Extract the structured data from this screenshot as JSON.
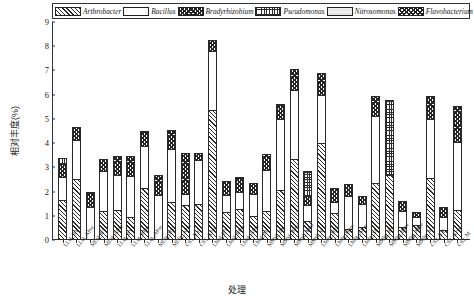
{
  "chart_data": {
    "type": "bar",
    "subtype": "stacked",
    "title": "",
    "xlabel": "处理",
    "ylabel": "相对丰度(%)",
    "ylim": [
      0,
      9
    ],
    "yticks": [
      0,
      1,
      2,
      3,
      4,
      5,
      6,
      7,
      8,
      9
    ],
    "grid": false,
    "legend_position": "top",
    "legend_italic": true,
    "categories": [
      "LLsl_BY",
      "LLsl_APre",
      "MLsl_BY",
      "MLsl_APre",
      "LLlg_BY",
      "LLlg_BPre",
      "LLlg_APre",
      "MLlg_BY",
      "MLlg_APre",
      "CS1_BY",
      "CS1_APre",
      "LMsl_BY",
      "LMsl_BPre",
      "LMsl_APre",
      "LMsl_M",
      "MMsl_BY",
      "MMsl_BPre",
      "MMsl_APre",
      "MMsl_M",
      "LMlg_BY",
      "LMlg_BPre",
      "LMlg_APre",
      "LMlg_M",
      "MMlg_BY",
      "MMlg_BPre",
      "MMlg_APre",
      "MMlg_M",
      "CS2_BY",
      "CS2_APre",
      "CS2_M"
    ],
    "series": [
      {
        "name": "Arthrobacter",
        "pattern": "diagonal-hatch",
        "values": [
          1.65,
          2.5,
          0.0,
          1.2,
          1.25,
          0.95,
          2.15,
          0.0,
          1.55,
          1.45,
          1.5,
          5.35,
          1.15,
          1.3,
          1.0,
          1.2,
          2.05,
          3.35,
          0.8,
          4.0,
          1.1,
          0.45,
          0.55,
          2.35,
          2.7,
          0.55,
          0.6,
          2.55,
          0.4,
          1.25
        ]
      },
      {
        "name": "Bacillus",
        "pattern": "solid-white",
        "values": [
          0.95,
          1.65,
          1.35,
          1.65,
          1.45,
          1.7,
          1.75,
          1.85,
          2.2,
          0.45,
          1.8,
          2.45,
          0.7,
          0.7,
          0.9,
          1.7,
          2.95,
          2.85,
          0.65,
          2.0,
          0.45,
          1.35,
          0.95,
          2.75,
          0.0,
          0.65,
          0.35,
          2.45,
          0.55,
          2.8
        ]
      },
      {
        "name": "Bradyrhizobium",
        "pattern": "cross-dense",
        "values": [
          0.55,
          0.5,
          0.65,
          0.5,
          0.75,
          0.8,
          0.6,
          0.85,
          0.8,
          1.7,
          0.3,
          0.45,
          0.6,
          0.6,
          0.45,
          0.65,
          0.6,
          0.85,
          0.35,
          0.9,
          0.6,
          0.5,
          0.3,
          0.85,
          0.0,
          0.4,
          0.2,
          0.95,
          0.4,
          1.5
        ]
      },
      {
        "name": "Pseudomonas",
        "pattern": "grid",
        "values": [
          0.25,
          0.0,
          0.0,
          0.0,
          0.0,
          0.0,
          0.0,
          0.0,
          0.0,
          0.0,
          0.0,
          0.0,
          0.0,
          0.0,
          0.0,
          0.0,
          0.0,
          0.0,
          1.05,
          0.0,
          0.0,
          0.0,
          0.0,
          0.0,
          3.1,
          0.0,
          0.0,
          0.0,
          0.0,
          0.0
        ]
      },
      {
        "name": "Nitrosomonas",
        "pattern": "light-fill",
        "values": [
          0.0,
          0.0,
          0.0,
          0.0,
          0.0,
          0.0,
          0.0,
          0.0,
          0.0,
          0.0,
          0.0,
          0.0,
          0.0,
          0.0,
          0.0,
          0.0,
          0.0,
          0.0,
          0.0,
          0.0,
          0.0,
          0.0,
          0.0,
          0.0,
          0.0,
          0.0,
          0.0,
          0.0,
          0.0,
          0.0
        ]
      },
      {
        "name": "Flavobacterium",
        "pattern": "diagonal-cross",
        "values": [
          0.0,
          0.0,
          0.0,
          0.0,
          0.0,
          0.0,
          0.0,
          0.0,
          0.0,
          0.0,
          0.0,
          0.0,
          0.0,
          0.0,
          0.0,
          0.0,
          0.0,
          0.0,
          0.0,
          0.0,
          0.0,
          0.0,
          0.0,
          0.0,
          0.0,
          0.0,
          0.0,
          0.0,
          0.0,
          0.0
        ]
      }
    ],
    "totals": [
      3.4,
      4.65,
      2.0,
      3.35,
      3.45,
      3.45,
      4.5,
      2.7,
      4.55,
      3.6,
      3.6,
      8.25,
      2.45,
      2.6,
      2.35,
      3.55,
      5.6,
      7.05,
      2.85,
      6.9,
      2.15,
      2.3,
      1.8,
      5.95,
      5.8,
      1.6,
      1.15,
      5.95,
      1.35,
      5.55
    ]
  },
  "legend": {
    "items": [
      {
        "label": "Arthrobacter",
        "pattern": "pat-arthrobacter"
      },
      {
        "label": "Bacillus",
        "pattern": "pat-bacillus"
      },
      {
        "label": "Bradyrhizobium",
        "pattern": "pat-bradyrhizobium"
      },
      {
        "label": "Pseudomonas",
        "pattern": "pat-pseudomonas"
      },
      {
        "label": "Nitrosomonas",
        "pattern": "pat-nitrosomonas"
      },
      {
        "label": "Flavobacterium",
        "pattern": "pat-flavobacterium"
      }
    ]
  }
}
